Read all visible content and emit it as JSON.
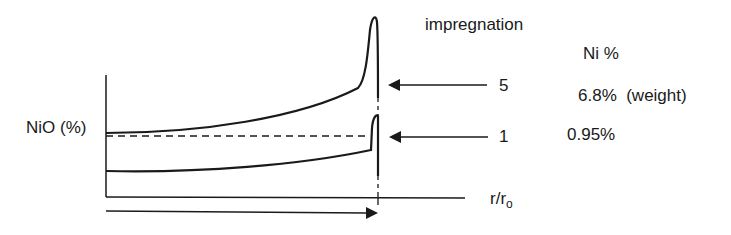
{
  "diagram": {
    "y_axis_label": "NiO (%)",
    "x_axis_label": "r/r",
    "x_axis_subscript": "o",
    "header_impregnation": "impregnation",
    "header_ni": "Ni %",
    "profiles": [
      {
        "impregnation": "5",
        "ni_percent": "6.8%",
        "note": "(weight)",
        "shape": "egg-shell peak, high surface concentration"
      },
      {
        "impregnation": "1",
        "ni_percent": "0.95%",
        "note": "",
        "shape": "small surface peak"
      }
    ],
    "reference_line": "dashed baseline",
    "direction_arrow": "radial direction"
  }
}
